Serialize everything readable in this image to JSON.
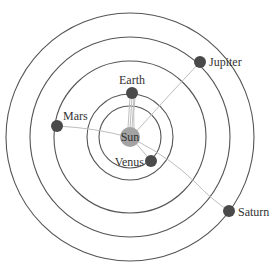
{
  "diagram": {
    "center": {
      "x": 130,
      "y": 137
    },
    "orbits": [
      {
        "name": "venus-orbit",
        "r": 31
      },
      {
        "name": "earth-orbit",
        "r": 43
      },
      {
        "name": "mars-orbit",
        "r": 76
      },
      {
        "name": "jupiter-orbit",
        "r": 100
      },
      {
        "name": "saturn-orbit",
        "r": 124
      }
    ],
    "sun": {
      "label": "Sun",
      "x": 130,
      "y": 137,
      "r": 10,
      "color": "#a3a3a3"
    },
    "planets": [
      {
        "label": "Earth",
        "x": 132,
        "y": 93,
        "r": 6,
        "label_pos": "top"
      },
      {
        "label": "Venus",
        "x": 151,
        "y": 161,
        "r": 6,
        "label_pos": "left"
      },
      {
        "label": "Mars",
        "x": 57,
        "y": 126,
        "r": 6,
        "label_pos": "right-top"
      },
      {
        "label": "Jupiter",
        "x": 200,
        "y": 62,
        "r": 6,
        "label_pos": "right"
      },
      {
        "label": "Saturn",
        "x": 229,
        "y": 211,
        "r": 6,
        "label_pos": "right"
      }
    ],
    "colors": {
      "orbit": "#555555",
      "link": "#bdbdbd",
      "planet": "#4a4a4a",
      "sun": "#a3a3a3",
      "text": "#333333"
    }
  }
}
